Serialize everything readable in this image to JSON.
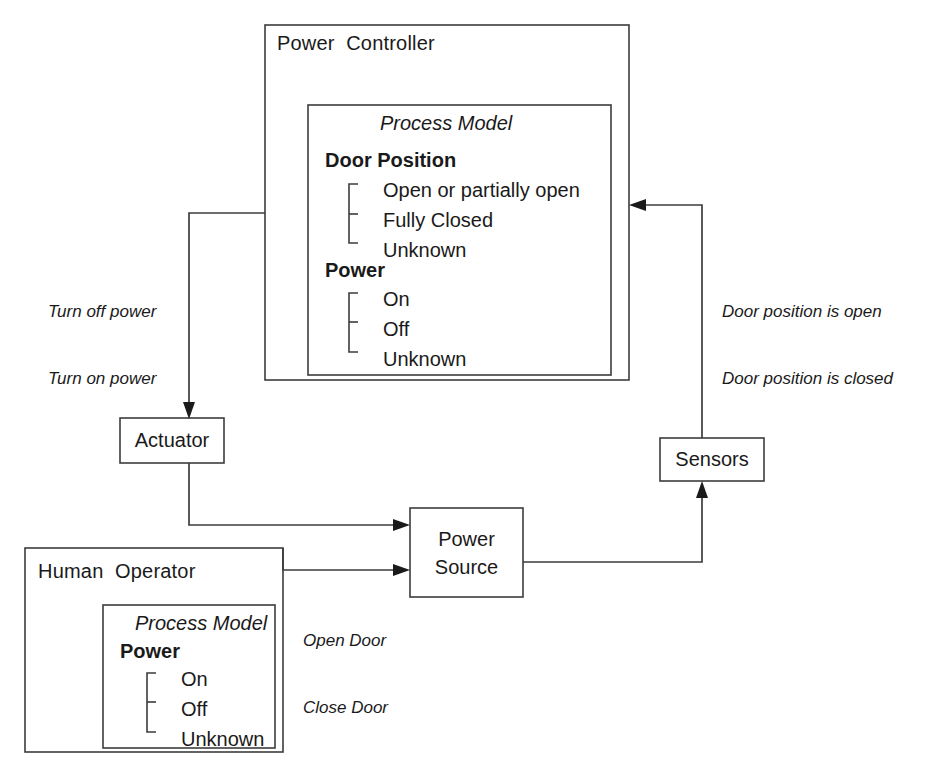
{
  "diagram": {
    "background": "#ffffff",
    "line_color": "#3c3c3c",
    "text_color": "#1a1a1a"
  },
  "controller": {
    "title": "Power  Controller",
    "process_model": {
      "title": "Process Model",
      "groups": [
        {
          "name": "Door Position",
          "items": [
            "Open or partially open",
            "Fully Closed",
            "Unknown"
          ]
        },
        {
          "name": "Power",
          "items": [
            "On",
            "Off",
            "Unknown"
          ]
        }
      ]
    }
  },
  "operator": {
    "title": "Human  Operator",
    "process_model": {
      "title": "Process Model",
      "groups": [
        {
          "name": "Power",
          "items": [
            "On",
            "Off",
            "Unknown"
          ]
        }
      ]
    }
  },
  "nodes": {
    "actuator": "Actuator",
    "power_source_line1": "Power",
    "power_source_line2": "Source",
    "sensors": "Sensors"
  },
  "edge_labels": {
    "control_actions": [
      "Turn off power",
      "Turn on power"
    ],
    "feedback": [
      "Door position is open",
      "Door position is closed"
    ],
    "operator_actions": [
      "Open Door",
      "Close Door"
    ]
  }
}
